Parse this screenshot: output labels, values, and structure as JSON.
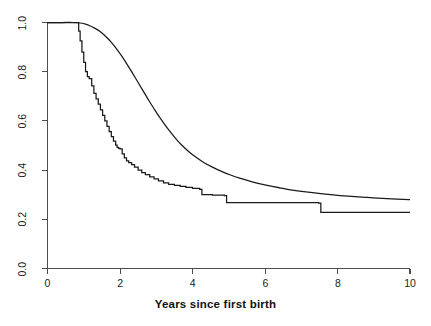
{
  "chart_data": {
    "type": "line",
    "title": "",
    "subtitle": "",
    "xlabel": "Years since first birth",
    "ylabel": "",
    "xlim": [
      0,
      10
    ],
    "ylim": [
      0,
      1.0
    ],
    "xticks": [
      0,
      2,
      4,
      6,
      8,
      10
    ],
    "xtick_labels": [
      "0",
      "2",
      "4",
      "6",
      "8",
      "10"
    ],
    "yticks": [
      0.0,
      0.2,
      0.4,
      0.6,
      0.8,
      1.0
    ],
    "ytick_labels": [
      "0.0",
      "0.2",
      "0.4",
      "0.6",
      "0.8",
      "1.0"
    ],
    "grid": false,
    "legend": "none",
    "annotations": [],
    "line_color": "#1a1a1a",
    "axis_color": "#4d4d4d",
    "background_color": "#ffffff",
    "series": [
      {
        "name": "smooth-survival-curve",
        "style": "smooth",
        "x": [
          0.0,
          0.4,
          0.7,
          0.85,
          0.95,
          1.05,
          1.15,
          1.3,
          1.45,
          1.6,
          1.75,
          1.9,
          2.05,
          2.2,
          2.35,
          2.5,
          2.65,
          2.8,
          2.95,
          3.1,
          3.25,
          3.4,
          3.55,
          3.7,
          3.9,
          4.1,
          4.3,
          4.55,
          4.8,
          5.05,
          5.3,
          5.6,
          5.9,
          6.2,
          6.55,
          6.9,
          7.25,
          7.6,
          7.95,
          8.3,
          8.7,
          9.1,
          9.5,
          9.8,
          10.0
        ],
        "y": [
          1.0,
          1.0,
          1.0,
          0.999,
          0.997,
          0.993,
          0.988,
          0.977,
          0.963,
          0.944,
          0.921,
          0.894,
          0.863,
          0.829,
          0.793,
          0.756,
          0.719,
          0.682,
          0.647,
          0.613,
          0.582,
          0.553,
          0.526,
          0.502,
          0.475,
          0.452,
          0.432,
          0.412,
          0.395,
          0.38,
          0.367,
          0.354,
          0.343,
          0.334,
          0.324,
          0.316,
          0.309,
          0.303,
          0.298,
          0.294,
          0.29,
          0.286,
          0.283,
          0.281,
          0.28
        ]
      },
      {
        "name": "kaplan-meier-step-curve",
        "style": "step",
        "x": [
          0.0,
          0.82,
          0.86,
          0.9,
          0.95,
          1.0,
          1.05,
          1.1,
          1.15,
          1.22,
          1.28,
          1.34,
          1.4,
          1.46,
          1.52,
          1.58,
          1.64,
          1.7,
          1.76,
          1.82,
          1.88,
          1.92,
          1.96,
          2.0,
          2.06,
          2.12,
          2.18,
          2.24,
          2.32,
          2.4,
          2.5,
          2.6,
          2.7,
          2.82,
          2.94,
          3.06,
          3.2,
          3.34,
          3.5,
          3.66,
          3.82,
          4.0,
          4.2,
          4.26,
          4.55,
          4.88,
          4.94,
          7.48,
          7.54,
          10.0
        ],
        "y": [
          1.0,
          1.0,
          0.965,
          0.925,
          0.88,
          0.838,
          0.8,
          0.78,
          0.772,
          0.742,
          0.712,
          0.69,
          0.668,
          0.645,
          0.622,
          0.6,
          0.578,
          0.556,
          0.536,
          0.518,
          0.502,
          0.492,
          0.488,
          0.486,
          0.466,
          0.45,
          0.438,
          0.43,
          0.422,
          0.412,
          0.4,
          0.39,
          0.382,
          0.372,
          0.364,
          0.356,
          0.348,
          0.342,
          0.338,
          0.334,
          0.33,
          0.326,
          0.322,
          0.3,
          0.298,
          0.296,
          0.268,
          0.266,
          0.228,
          0.228
        ]
      }
    ]
  },
  "axes": {
    "x_axis_name": "x-axis",
    "y_axis_name": "y-axis"
  }
}
